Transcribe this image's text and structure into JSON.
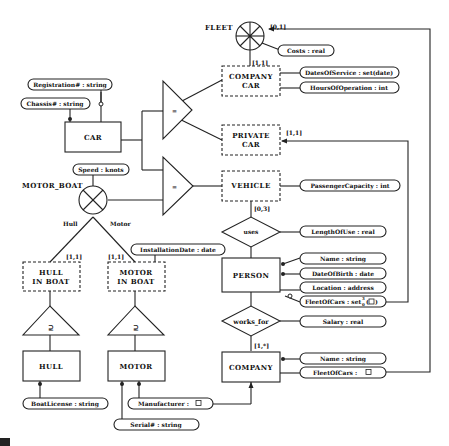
{
  "entities": {
    "fleet": "FLEET",
    "company_car": [
      "COMPANY",
      "CAR"
    ],
    "car": "CAR",
    "private_car": [
      "PRIVATE",
      "CAR"
    ],
    "vehicle": "VEHICLE",
    "motor_boat": "MOTOR_BOAT",
    "person": "PERSON",
    "hull_in_boat": [
      "HULL",
      "IN BOAT"
    ],
    "motor_in_boat": [
      "MOTOR",
      "IN BOAT"
    ],
    "hull": "HULL",
    "motor": "MOTOR",
    "company": "COMPANY"
  },
  "relationships": {
    "uses": "uses",
    "works_for": "works_for"
  },
  "roles": {
    "hull": "Hull",
    "motor": "Motor"
  },
  "generalization_symbols": {
    "car_isa": "=",
    "vehicle_isa": "=",
    "hull_sub": "⊇",
    "motor_sub": "⊇"
  },
  "cardinalities": {
    "fleet_company_car": "[0,1]",
    "company_car": "[1,1]",
    "private_car": "[1,1]",
    "vehicle_uses": "[0,3]",
    "hull_in_boat": "[1,1]",
    "motor_in_boat": "[1,1]",
    "company_works_for": "[1,*]"
  },
  "attributes": {
    "registration": "Registration# : string",
    "chassis": "Chassis# : string",
    "costs": "Costs : real",
    "dates_of_service": "DatesOfService : set(date)",
    "hours_of_operation": "HoursOfOperation : int",
    "speed": "Speed : knots",
    "passenger_capacity": "PassengerCapacity : int",
    "installation_date": "InstallationDate : date",
    "length_of_use": "LengthOfUse : real",
    "person_name": "Name : string",
    "date_of_birth": "DateOfBirth : date",
    "location": "Location : address",
    "person_fleet_of_cars": "FleetOfCars : set",
    "person_fleet_of_cars_suffix": "3",
    "person_fleet_of_cars_sub": "0",
    "salary": "Salary : real",
    "company_name": "Name : string",
    "company_fleet_of_cars": "FleetOfCars :",
    "boat_license": "BoatLicense : string",
    "manufacturer": "Manufacturer :",
    "serial": "Serial# : string"
  }
}
